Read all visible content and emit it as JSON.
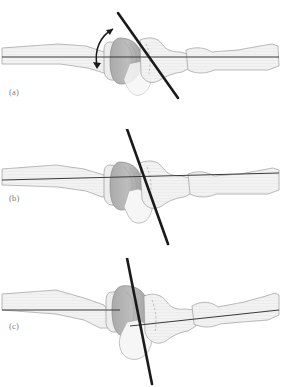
{
  "figure": {
    "background_color": "#ffffff",
    "panel_count": 3
  },
  "panels": [
    {
      "label": "(a)",
      "caption": "",
      "axis_line": {
        "proximal_angle_deg": 0,
        "distal_angle_deg": 0,
        "description": "single straight horizontal reference axis through both bones"
      },
      "oblique_line": {
        "x1": 118,
        "y1": 13,
        "x2": 178,
        "y2": 98,
        "angle_deg": 55,
        "width_px": 2.6,
        "color": "#1a1a1a"
      },
      "motion_arrow": {
        "present": true,
        "type": "curved-double-headed",
        "tip_start_x": 115,
        "tip_start_y": 27,
        "tip_end_x": 96,
        "tip_end_y": 69,
        "color": "#1a1a1a"
      }
    },
    {
      "label": "(b)",
      "caption": "",
      "axis_line": {
        "proximal_angle_deg": 0,
        "distal_angle_deg": 0,
        "description": "single straight horizontal reference axis through both bones"
      },
      "oblique_line": {
        "x1": 127,
        "y1": 128,
        "x2": 168,
        "y2": 243,
        "angle_deg": 70,
        "width_px": 2.6,
        "color": "#1a1a1a"
      },
      "motion_arrow": {
        "present": false,
        "type": "",
        "tip_start_x": 0,
        "tip_start_y": 0,
        "tip_end_x": 0,
        "tip_end_y": 0,
        "color": ""
      }
    },
    {
      "label": "(c)",
      "caption": "",
      "axis_line": {
        "proximal_angle_deg": 0,
        "distal_angle_deg": -6,
        "description": "proximal axis horizontal; distal axis deviated upward to the right"
      },
      "oblique_line": {
        "x1": 127,
        "y1": 257,
        "x2": 152,
        "y2": 384,
        "angle_deg": 79,
        "width_px": 2.6,
        "color": "#1a1a1a"
      },
      "motion_arrow": {
        "present": false,
        "type": "",
        "tip_start_x": 0,
        "tip_start_y": 0,
        "tip_end_x": 0,
        "tip_end_y": 0,
        "color": ""
      }
    }
  ],
  "anatomy": {
    "bone_fill": "#f2f2f2",
    "bone_fill_alt": "#ededed",
    "bone_outline": "#9a9a9a",
    "condyle_fill": "#b5b5b5",
    "condyle_outline": "#8a8a8a",
    "sesamoid_fill": "#c9c9c9",
    "hatch_color": "#d4d4d4",
    "hidden_edge_color": "#8e8e8e",
    "axis_color": "#3a3a3a",
    "parts": [
      {
        "name": "proximal-shaft",
        "side": "left"
      },
      {
        "name": "proximal-condyle",
        "side": "center-left"
      },
      {
        "name": "sesamoid",
        "side": "center"
      },
      {
        "name": "middle-phalanx",
        "side": "center-right"
      },
      {
        "name": "distal-phalanx",
        "side": "right"
      }
    ]
  },
  "label_style": {
    "color": "#7e7e7e",
    "font_size_px": 8.5
  }
}
